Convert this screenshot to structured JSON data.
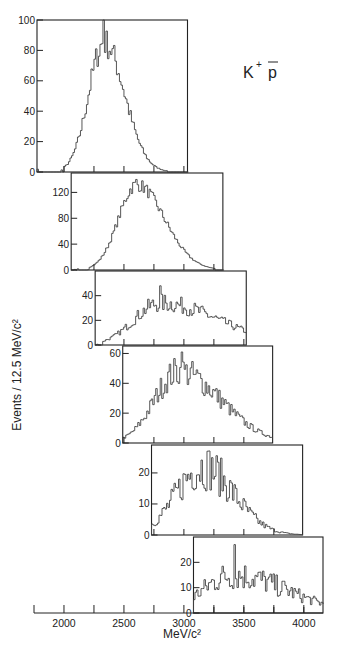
{
  "chart_data": {
    "type": "bar",
    "style": "stacked histograms (step plots), each panel offset along a shared mass axis",
    "title": "",
    "annotation": "K⁺ p̄",
    "annotation_parts": {
      "particle1": "K",
      "sup": "+",
      "particle2": "p"
    },
    "xlabel": "MeV/c²",
    "ylabel": "Events / 12.5 MeV/c²",
    "x_axis": {
      "range": [
        1750,
        4160
      ],
      "major_ticks": [
        2000,
        2500,
        3000,
        3500,
        4000
      ],
      "minor_ticks": [
        1750,
        2250,
        2750,
        3250,
        3750
      ],
      "tick_labels": [
        "2000",
        "2500",
        "3000",
        "3500",
        "4000"
      ]
    },
    "bin_width": 12.5,
    "panels": [
      {
        "name": "panel-1",
        "x_range": [
          1775,
          3030
        ],
        "ylim": [
          0,
          100
        ],
        "y_ticks": [
          0,
          20,
          40,
          60,
          80,
          100
        ],
        "y_tick_labels": [
          "0",
          "20",
          "40",
          "60",
          "80",
          "100"
        ],
        "peak": {
          "x": 2330,
          "y": 100
        },
        "shape": {
          "start": 2000,
          "rise_center": 2330,
          "sigma_left": 130,
          "sigma_right": 170,
          "end": 2850,
          "amplitude": 85,
          "noise": 0.12
        }
      },
      {
        "name": "panel-2",
        "x_range": [
          2060,
          3325
        ],
        "ylim": [
          0,
          150
        ],
        "y_ticks": [
          0,
          40,
          80,
          120
        ],
        "y_tick_labels": [
          "0",
          "40",
          "80",
          "120"
        ],
        "peak": {
          "x": 2600,
          "y": 140
        },
        "shape": {
          "start": 2200,
          "rise_center": 2600,
          "sigma_left": 150,
          "sigma_right": 230,
          "end": 3250,
          "amplitude": 132,
          "noise": 0.08
        }
      },
      {
        "name": "panel-3",
        "x_range": [
          2260,
          3520
        ],
        "ylim": [
          0,
          60
        ],
        "y_ticks": [
          0,
          20,
          40
        ],
        "y_tick_labels": [
          "0",
          "20",
          "40"
        ],
        "peak": {
          "x": 2800,
          "y": 48
        },
        "shape": {
          "start": 2320,
          "rise_center": 2800,
          "sigma_left": 220,
          "sigma_right": 480,
          "end": 3520,
          "amplitude": 34,
          "noise": 0.22
        }
      },
      {
        "name": "panel-4",
        "x_range": [
          2490,
          3740
        ],
        "ylim": [
          0,
          65
        ],
        "y_ticks": [
          0,
          20,
          40,
          60
        ],
        "y_tick_labels": [
          "0",
          "20",
          "40",
          "60"
        ],
        "peak": {
          "x": 2980,
          "y": 61
        },
        "shape": {
          "start": 2490,
          "rise_center": 2950,
          "sigma_left": 200,
          "sigma_right": 350,
          "end": 3740,
          "amplitude": 48,
          "noise": 0.22
        }
      },
      {
        "name": "panel-5",
        "x_range": [
          2730,
          3990
        ],
        "ylim": [
          0,
          29
        ],
        "y_ticks": [
          0,
          10,
          20
        ],
        "y_tick_labels": [
          "0",
          "10",
          "20"
        ],
        "peak": {
          "x": 3190,
          "y": 27
        },
        "shape": {
          "start": 2730,
          "rise_center": 3150,
          "sigma_left": 220,
          "sigma_right": 260,
          "end": 3990,
          "amplitude": 22,
          "noise": 0.35
        }
      },
      {
        "name": "panel-6",
        "x_range": [
          3080,
          4160
        ],
        "ylim": [
          0,
          30
        ],
        "y_ticks": [
          0,
          10,
          20
        ],
        "y_tick_labels": [
          "0",
          "10",
          "20"
        ],
        "peak": {
          "x": 3420,
          "y": 27
        },
        "shape": {
          "start": 3080,
          "rise_center": 3400,
          "sigma_left": 250,
          "sigma_right": 450,
          "end": 4160,
          "amplitude": 15,
          "noise": 0.4
        }
      }
    ]
  }
}
